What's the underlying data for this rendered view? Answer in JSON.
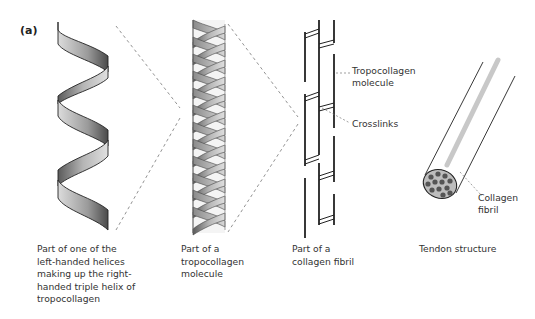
{
  "figure": {
    "panel_label": "(a)",
    "stages": [
      {
        "id": "single-helix",
        "caption_lines": [
          "Part of one of the",
          "left-handed helices",
          "making up the right-",
          "handed triple helix of",
          "tropocollagen"
        ]
      },
      {
        "id": "tropocollagen-molecule",
        "caption_lines": [
          "Part of a",
          "tropocollagen",
          "molecule"
        ]
      },
      {
        "id": "collagen-fibril",
        "caption_lines": [
          "Part of a",
          "collagen fibril"
        ]
      },
      {
        "id": "tendon",
        "caption_lines": [
          "Tendon structure"
        ]
      }
    ],
    "callouts": {
      "tropocollagen_molecule": [
        "Tropocollagen",
        "molecule"
      ],
      "crosslinks": [
        "Crosslinks"
      ],
      "collagen_fibril": [
        "Collagen",
        "fibril"
      ]
    },
    "colors": {
      "ribbon_dark": "#555555",
      "ribbon_light": "#d4d4d4",
      "outline": "#222222",
      "dash": "#777777",
      "fibril_highlight": "#c8c8c8",
      "fibril_dot": "#555555",
      "cross_section": "#bdbdbd"
    }
  }
}
